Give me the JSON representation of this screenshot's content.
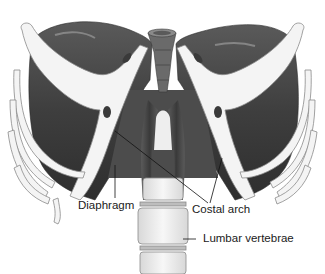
{
  "figure": {
    "labels": [
      {
        "id": "diaphragm",
        "text": "Diaphragm"
      },
      {
        "id": "costal_arch",
        "text": "Costal arch"
      },
      {
        "id": "lumbar_vertebrae",
        "text": "Lumbar vertebrae"
      }
    ]
  },
  "colors": {
    "background": "#ffffff",
    "bone": "#f4f4f4",
    "bone_outline": "#8a8a8a",
    "muscle_dark": "#4a4a4a",
    "muscle_mid": "#6e6e6e",
    "leader_line": "#111111",
    "label_text": "#1a1a1a"
  }
}
